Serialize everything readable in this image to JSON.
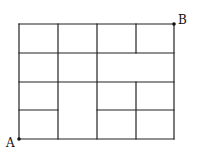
{
  "diagram": {
    "labels": {
      "start": "A",
      "end": "B"
    },
    "grid": {
      "x": [
        19,
        58,
        97,
        136,
        174
      ],
      "y": [
        24,
        53,
        82,
        110,
        139
      ]
    },
    "segments": [
      [
        19,
        24,
        174,
        24
      ],
      [
        19,
        53,
        174,
        53
      ],
      [
        19,
        82,
        174,
        82
      ],
      [
        19,
        139,
        174,
        139
      ],
      [
        19,
        110,
        58,
        110
      ],
      [
        97,
        110,
        174,
        110
      ],
      [
        19,
        24,
        19,
        139
      ],
      [
        58,
        24,
        58,
        139
      ],
      [
        97,
        24,
        97,
        139
      ],
      [
        174,
        24,
        174,
        139
      ],
      [
        136,
        24,
        136,
        53
      ],
      [
        136,
        82,
        136,
        139
      ]
    ],
    "line_color": "#222222"
  }
}
